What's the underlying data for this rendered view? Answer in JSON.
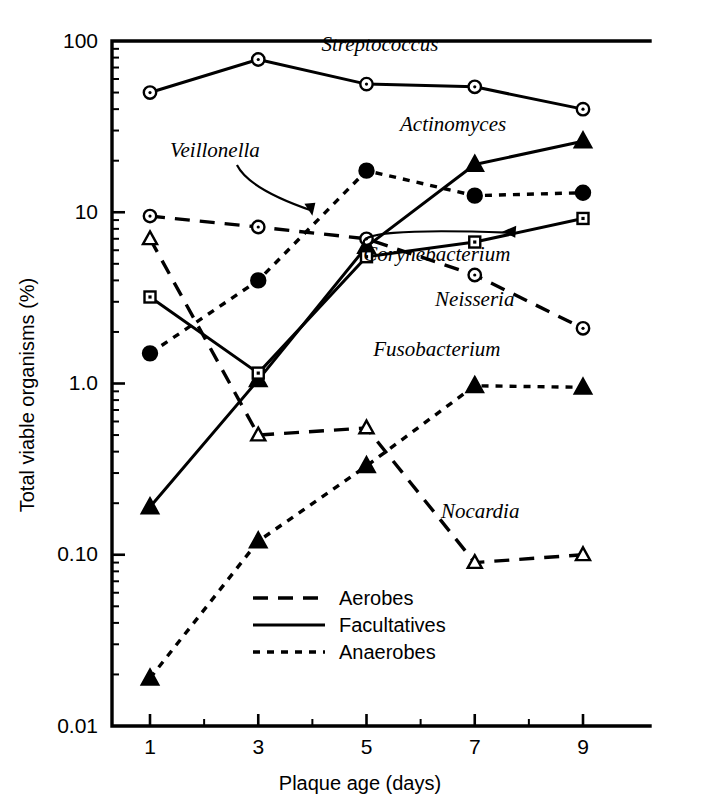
{
  "chart_data": {
    "type": "line",
    "title": "",
    "xlabel": "Plaque age (days)",
    "ylabel": "Total viable organisms (%)",
    "x": [
      1,
      3,
      5,
      7,
      9
    ],
    "xtick_labels": [
      "1",
      "3",
      "5",
      "7",
      "9"
    ],
    "ytick_labels": [
      "100",
      "10",
      "1.0",
      "0.10",
      "0.01"
    ],
    "ytick_values": [
      100,
      10,
      1.0,
      0.1,
      0.01
    ],
    "ylim": [
      0.01,
      100
    ],
    "yscale": "log",
    "xlim": [
      0.3,
      10
    ],
    "grid": false,
    "legend_position": "bottom-center",
    "series": [
      {
        "name": "Streptococcus",
        "group": "Facultatives",
        "linestyle": "solid",
        "marker": "open-circle",
        "values": [
          50,
          78,
          56,
          54,
          40
        ],
        "label_x": 5.25,
        "label_y": 88,
        "leader": false
      },
      {
        "name": "Actinomyces",
        "group": "Facultatives",
        "linestyle": "solid",
        "marker": "filled-triangle",
        "values": [
          0.19,
          1.05,
          6.3,
          19,
          26
        ],
        "label_x": 6.6,
        "label_y": 30,
        "leader": false
      },
      {
        "name": "Veillonella",
        "group": "Anaerobes",
        "linestyle": "dotted",
        "marker": "filled-circle",
        "values": [
          1.5,
          4.0,
          17.5,
          12.5,
          13
        ],
        "label_x": 2.2,
        "label_y": 21,
        "leader": true
      },
      {
        "name": "Corynebacterium",
        "group": "Facultatives",
        "linestyle": "solid",
        "marker": "open-square",
        "values": [
          3.2,
          1.15,
          5.5,
          6.7,
          9.2
        ],
        "label_x": 6.3,
        "label_y": 5.2,
        "leader": true
      },
      {
        "name": "Neisseria",
        "group": "Aerobes",
        "linestyle": "dashed",
        "marker": "open-circle",
        "values": [
          9.5,
          8.2,
          7.0,
          4.3,
          2.1
        ],
        "label_x": 7.0,
        "label_y": 2.85,
        "leader": false
      },
      {
        "name": "Fusobacterium",
        "group": "Anaerobes",
        "linestyle": "dotted",
        "marker": "filled-triangle",
        "values": [
          0.019,
          0.12,
          0.33,
          0.97,
          0.95
        ],
        "label_x": 6.3,
        "label_y": 1.45,
        "leader": false
      },
      {
        "name": "Nocardia",
        "group": "Aerobes",
        "linestyle": "dashed",
        "marker": "open-triangle",
        "values": [
          7.0,
          0.5,
          0.55,
          0.09,
          0.1
        ],
        "label_x": 7.1,
        "label_y": 0.165,
        "leader": false
      }
    ],
    "legend": [
      {
        "label": "Aerobes",
        "linestyle": "dashed"
      },
      {
        "label": "Facultatives",
        "linestyle": "solid"
      },
      {
        "label": "Anaerobes",
        "linestyle": "dotted"
      }
    ],
    "colors": {
      "ink": "#000000",
      "background": "#ffffff"
    }
  }
}
